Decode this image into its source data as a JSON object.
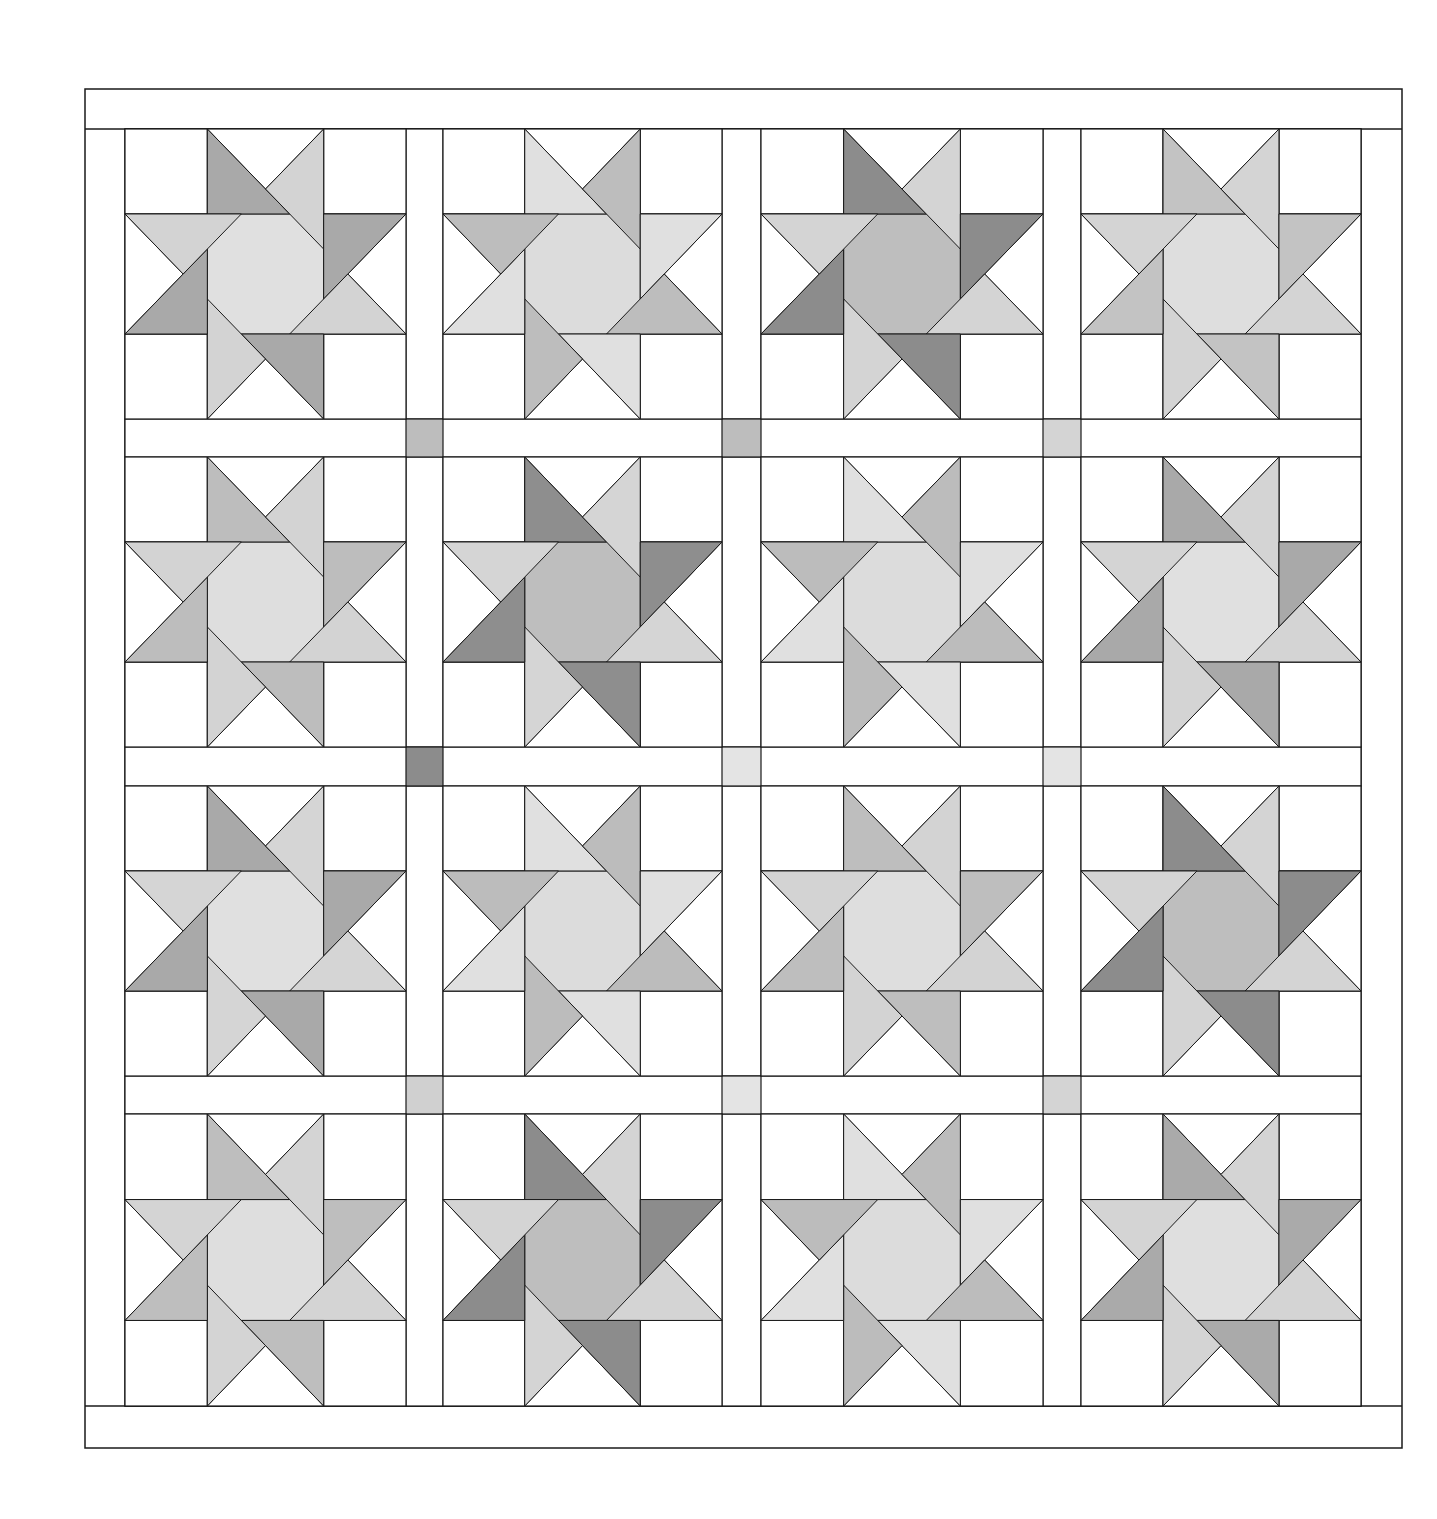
{
  "diagram": {
    "type": "quilt-layout",
    "rows": 4,
    "cols": 4,
    "line_color": "#1a1a1a",
    "background": "#ffffff",
    "outer_border": {
      "x1": 85,
      "y1": 89,
      "x2": 1402,
      "y2": 1448
    },
    "inner_field": {
      "x1": 125,
      "y1": 129,
      "x2": 1361,
      "y2": 1406
    },
    "col_bounds": [
      [
        125,
        406
      ],
      [
        443,
        722
      ],
      [
        761,
        1043
      ],
      [
        1081,
        1361
      ]
    ],
    "row_bounds": [
      [
        129,
        419
      ],
      [
        457,
        747
      ],
      [
        786,
        1076
      ],
      [
        1114,
        1406
      ]
    ],
    "block_grid_fractions": [
      0,
      0.293,
      0.707,
      1
    ],
    "blocks": [
      [
        {
          "A": "#a9a9a9",
          "B": "#d3d3d3",
          "C": "#e0e0e0"
        },
        {
          "A": "#e0e0e0",
          "B": "#bdbdbd",
          "C": "#dcdcdc"
        },
        {
          "A": "#8c8c8c",
          "B": "#d4d4d4",
          "C": "#bebebe"
        },
        {
          "A": "#c3c3c3",
          "B": "#d4d4d4",
          "C": "#dedede"
        }
      ],
      [
        {
          "A": "#bdbdbd",
          "B": "#d3d3d3",
          "C": "#dedede"
        },
        {
          "A": "#8e8e8e",
          "B": "#d5d5d5",
          "C": "#bebebe"
        },
        {
          "A": "#e0e0e0",
          "B": "#bcbcbc",
          "C": "#dcdcdc"
        },
        {
          "A": "#a9a9a9",
          "B": "#d4d4d4",
          "C": "#e0e0e0"
        }
      ],
      [
        {
          "A": "#a9a9a9",
          "B": "#d5d5d5",
          "C": "#e0e0e0"
        },
        {
          "A": "#e0e0e0",
          "B": "#bcbcbc",
          "C": "#dcdcdc"
        },
        {
          "A": "#bebebe",
          "B": "#d3d3d3",
          "C": "#dedede"
        },
        {
          "A": "#8c8c8c",
          "B": "#d4d4d4",
          "C": "#bebebe"
        }
      ],
      [
        {
          "A": "#bebebe",
          "B": "#d4d4d4",
          "C": "#dedede"
        },
        {
          "A": "#8c8c8c",
          "B": "#d4d4d4",
          "C": "#bebebe"
        },
        {
          "A": "#e0e0e0",
          "B": "#bcbcbc",
          "C": "#dcdcdc"
        },
        {
          "A": "#aaaaaa",
          "B": "#d4d4d4",
          "C": "#dfdfdf"
        }
      ]
    ],
    "cornerstones": [
      [
        "#bdbdbd",
        "#bdbdbd",
        "#d4d4d4"
      ],
      [
        "#8c8c8c",
        "#e4e4e4",
        "#e4e4e4"
      ],
      [
        "#d0d0d0",
        "#e4e4e4",
        "#d4d4d4"
      ]
    ]
  }
}
